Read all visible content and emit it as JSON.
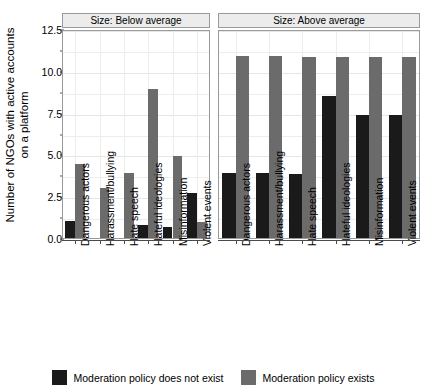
{
  "chart_data": {
    "type": "bar",
    "title": "",
    "xlabel": "",
    "ylabel": "Number of NGOs with active accounts on a platform",
    "ylabel_lines": [
      "Number of NGOs with active accounts",
      "on a platform"
    ],
    "ylim": [
      0,
      12.5
    ],
    "yticks": [
      0.0,
      2.5,
      5.0,
      7.5,
      10.0,
      12.5
    ],
    "ytick_labels": [
      "0.0",
      "2.5",
      "5.0",
      "7.5",
      "10.0",
      "12.5"
    ],
    "yminor_ticks": [
      1.25,
      3.75,
      6.25,
      8.75,
      11.25
    ],
    "grid": true,
    "legend_position": "bottom",
    "categories": [
      "Dangerous actors",
      "Harassment/bullying",
      "Hate speech",
      "Hateful ideologies",
      "Misinformation",
      "Violent events"
    ],
    "facets": [
      {
        "label": "Size: Below average",
        "series": [
          {
            "name": "Moderation policy does not exist",
            "color": "#1a1a1a",
            "values": [
              1.0,
              0.0,
              0.0,
              0.75,
              0.65,
              2.7
            ]
          },
          {
            "name": "Moderation policy exists",
            "color": "#6b6b6b",
            "values": [
              4.45,
              3.0,
              3.9,
              8.9,
              4.9,
              0.95
            ]
          }
        ]
      },
      {
        "label": "Size: Above average",
        "series": [
          {
            "name": "Moderation policy does not exist",
            "color": "#1a1a1a",
            "values": [
              3.9,
              3.9,
              3.85,
              8.5,
              7.35,
              7.35
            ]
          },
          {
            "name": "Moderation policy exists",
            "color": "#6b6b6b",
            "values": [
              10.9,
              10.9,
              10.85,
              10.85,
              10.85,
              10.8
            ]
          }
        ]
      }
    ],
    "legend": [
      {
        "label": "Moderation policy does not exist",
        "color": "#1a1a1a"
      },
      {
        "label": "Moderation policy exists",
        "color": "#6b6b6b"
      }
    ]
  }
}
